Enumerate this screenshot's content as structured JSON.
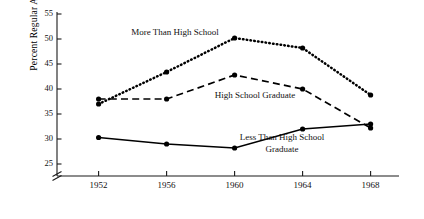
{
  "chart_data": {
    "type": "line",
    "title": "",
    "subtitle": "",
    "xlabel": "",
    "ylabel": "Percent Regular Attendance",
    "categories": [
      "1952",
      "1956",
      "1960",
      "1964",
      "1968"
    ],
    "x": [
      1952,
      1956,
      1960,
      1964,
      1968
    ],
    "xlim": [
      1950.2,
      1969.2
    ],
    "ylim": [
      24.2,
      55.6
    ],
    "yticks": [
      25,
      30,
      35,
      40,
      45,
      50,
      55
    ],
    "ytick_labels": [
      "25",
      "30",
      "35",
      "40",
      "45",
      "50",
      "55"
    ],
    "xticks": [
      1952,
      1956,
      1960,
      1964,
      1968
    ],
    "grid": false,
    "axis_break": {
      "present": true,
      "below_value": 25,
      "note": "y-axis broken below 25"
    },
    "legend": "inline-annotations",
    "series": [
      {
        "name": "More Than High School",
        "style": "dotted",
        "marker": "filled-circle",
        "values": [
          37.0,
          43.4,
          50.2,
          48.2,
          38.8
        ]
      },
      {
        "name": "High School Graduate",
        "style": "dashed",
        "marker": "filled-circle",
        "values": [
          38.0,
          38.0,
          42.8,
          40.0,
          32.2
        ]
      },
      {
        "name": "Less Than High School Graduate",
        "style": "solid",
        "marker": "filled-circle",
        "values": [
          30.3,
          29.0,
          28.2,
          32.0,
          33.0
        ]
      }
    ],
    "annotations": [
      {
        "id": "more-than-hs",
        "text": "More Than High School",
        "x": 175,
        "y": 35
      },
      {
        "id": "hs-grad",
        "text": "High School Graduate",
        "x": 255,
        "y": 98
      },
      {
        "id": "less-than-hs-line1",
        "text": "Less Than High School",
        "x": 282,
        "y": 140
      },
      {
        "id": "less-than-hs-line2",
        "text": "Graduate",
        "x": 282,
        "y": 152
      }
    ],
    "colors": {
      "axis": "#1a1a1a",
      "text": "#111111",
      "series_more_than_hs": "#000000",
      "series_hs_grad": "#000000",
      "series_less_than_hs": "#000000",
      "background": "#ffffff"
    }
  }
}
